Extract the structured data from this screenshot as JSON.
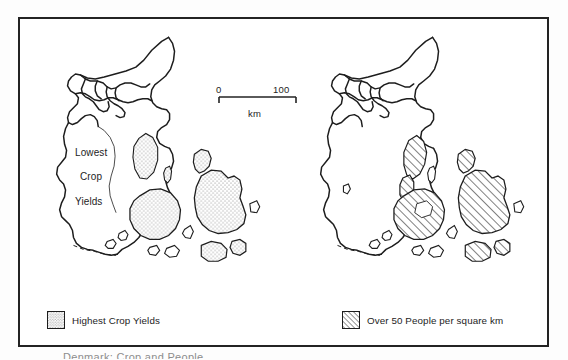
{
  "figure": {
    "caption": "Denmark: Crop and People",
    "frame_color": "#232323",
    "background_color": "#ffffff"
  },
  "scale": {
    "zero_label": "0",
    "max_label": "100",
    "unit_label": "km"
  },
  "maps": [
    {
      "id": "crop-yields",
      "position": "left",
      "pattern": "stipple",
      "inmap_labels": [
        "Lowest",
        "Crop",
        "Yields"
      ],
      "legend": {
        "swatch": "stipple-swatch",
        "label": "Highest Crop Yields"
      }
    },
    {
      "id": "population-density",
      "position": "right",
      "pattern": "diagonal-hatch",
      "inmap_labels": [],
      "legend": {
        "swatch": "hatch-swatch",
        "label": "Over 50 People per square km"
      }
    }
  ],
  "labels": {
    "lowest": "Lowest",
    "crop": "Crop",
    "yields": "Yields",
    "legend_left": "Highest Crop Yields",
    "legend_right": "Over 50 People per square km"
  },
  "colors": {
    "ink": "#1d1d1d",
    "frame": "#232323",
    "paper": "#ffffff",
    "stipple": "#8a8a8a",
    "hatch": "#2a2a2a"
  }
}
